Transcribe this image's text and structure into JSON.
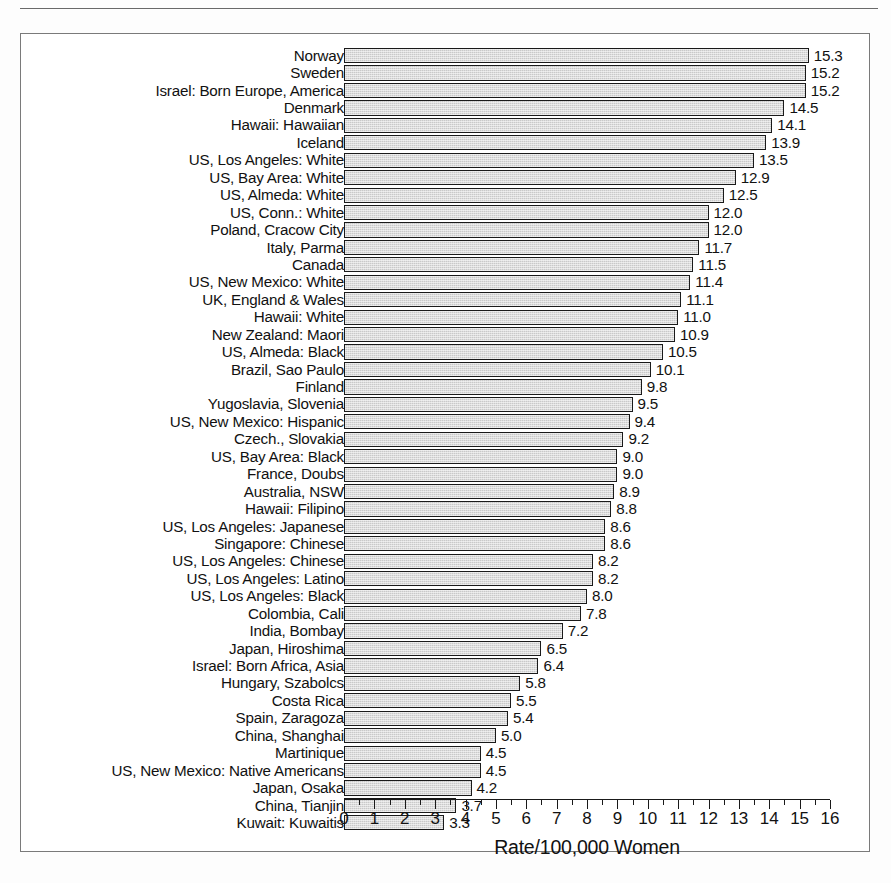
{
  "chart_data": {
    "type": "bar",
    "orientation": "horizontal",
    "title": "",
    "xlabel": "Rate/100,000 Women",
    "ylabel": "",
    "xlim": [
      0,
      16
    ],
    "xticks": [
      0,
      1,
      2,
      3,
      4,
      5,
      6,
      7,
      8,
      9,
      10,
      11,
      12,
      13,
      14,
      15,
      16
    ],
    "xtick_labels": [
      "0",
      "1",
      "2",
      "3",
      "4",
      "5",
      "6",
      "7",
      "8",
      "9",
      "10",
      "11",
      "12",
      "13",
      "14",
      "15",
      "16"
    ],
    "grid": false,
    "legend": false,
    "bar_fill_color": "#c9c9c9",
    "bar_edge_color": "#1a1a1a",
    "categories": [
      "Norway",
      "Sweden",
      "Israel: Born Europe, America",
      "Denmark",
      "Hawaii: Hawaiian",
      "Iceland",
      "US, Los Angeles: White",
      "US, Bay Area: White",
      "US, Almeda: White",
      "US, Conn.: White",
      "Poland, Cracow City",
      "Italy, Parma",
      "Canada",
      "US, New Mexico: White",
      "UK, England & Wales",
      "Hawaii: White",
      "New Zealand: Maori",
      "US, Almeda: Black",
      "Brazil, Sao Paulo",
      "Finland",
      "Yugoslavia, Slovenia",
      "US, New Mexico: Hispanic",
      "Czech., Slovakia",
      "US, Bay Area: Black",
      "France, Doubs",
      "Australia, NSW",
      "Hawaii: Filipino",
      "US, Los Angeles: Japanese",
      "Singapore: Chinese",
      "US, Los Angeles: Chinese",
      "US, Los Angeles: Latino",
      "US, Los Angeles: Black",
      "Colombia, Cali",
      "India, Bombay",
      "Japan, Hiroshima",
      "Israel: Born Africa, Asia",
      "Hungary, Szabolcs",
      "Costa Rica",
      "Spain, Zaragoza",
      "China, Shanghai",
      "Martinique",
      "US, New Mexico: Native Americans",
      "Japan, Osaka",
      "China, Tianjin",
      "Kuwait: Kuwaitis"
    ],
    "values": [
      15.3,
      15.2,
      15.2,
      14.5,
      14.1,
      13.9,
      13.5,
      12.9,
      12.5,
      12.0,
      12.0,
      11.7,
      11.5,
      11.4,
      11.1,
      11.0,
      10.9,
      10.5,
      10.1,
      9.8,
      9.5,
      9.4,
      9.2,
      9.0,
      9.0,
      8.9,
      8.8,
      8.6,
      8.6,
      8.2,
      8.2,
      8.0,
      7.8,
      7.2,
      6.5,
      6.4,
      5.8,
      5.5,
      5.4,
      5.0,
      4.5,
      4.5,
      4.2,
      3.7,
      3.3
    ],
    "value_labels": [
      "15.3",
      "15.2",
      "15.2",
      "14.5",
      "14.1",
      "13.9",
      "13.5",
      "12.9",
      "12.5",
      "12.0",
      "12.0",
      "11.7",
      "11.5",
      "11.4",
      "11.1",
      "11.0",
      "10.9",
      "10.5",
      "10.1",
      "9.8",
      "9.5",
      "9.4",
      "9.2",
      "9.0",
      "9.0",
      "8.9",
      "8.8",
      "8.6",
      "8.6",
      "8.2",
      "8.2",
      "8.0",
      "7.8",
      "7.2",
      "6.5",
      "6.4",
      "5.8",
      "5.5",
      "5.4",
      "5.0",
      "4.5",
      "4.5",
      "4.2",
      "3.7",
      "3.3"
    ]
  }
}
